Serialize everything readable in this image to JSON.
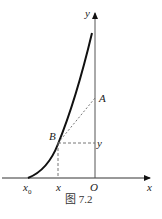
{
  "labels": {
    "y_axis": "y",
    "x_axis": "x",
    "origin": "O",
    "point_a": "A",
    "point_b": "B",
    "y_coord": "y",
    "x_coord": "x",
    "x0": "x",
    "x0_sub": "0"
  },
  "caption": "图 7.2",
  "colors": {
    "ink": "#111111"
  }
}
